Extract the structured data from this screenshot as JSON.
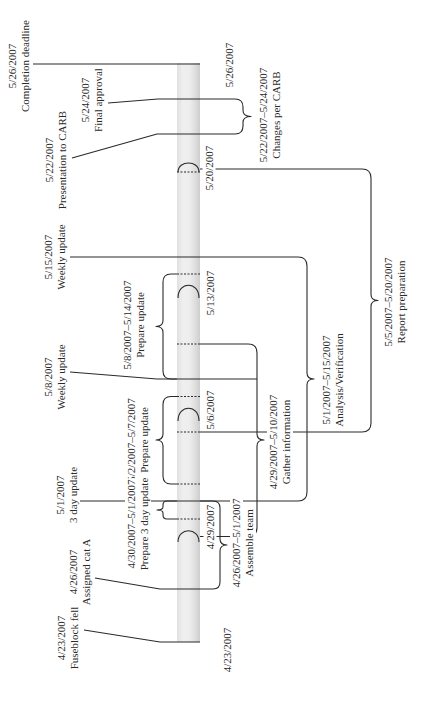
{
  "diagram": {
    "type": "timeline",
    "colors": {
      "line": "#2a2a2a",
      "bar": "#e6e6e6",
      "background": "#ffffff"
    },
    "events": [
      {
        "date": "5/26/2007",
        "label": "Completion deadline"
      },
      {
        "date": "5/24/2007",
        "label": "Final approval"
      },
      {
        "date": "5/22/2007",
        "label": "Presentation to CARB"
      },
      {
        "date": "5/15/2007",
        "label": "Weekly update"
      },
      {
        "date": "5/8/2007",
        "label": "Weekly update"
      },
      {
        "date": "5/1/2007",
        "label": "3 day update"
      },
      {
        "date": "4/26/2007",
        "label": "Assigned cat A"
      },
      {
        "date": "4/23/2007",
        "label": "Fuseblock fell"
      }
    ],
    "tasks_left": [
      {
        "range": "5/8/2007–5/14/2007",
        "label": "Prepare update"
      },
      {
        "range": "5/2/2007–5/7/2007",
        "label": "Prepare update"
      },
      {
        "range": "4/30/2007–5/1/2007",
        "label": "Prepare 3 day update"
      }
    ],
    "tasks_right": [
      {
        "range": "5/22/2007–5/24/2007",
        "label": "Changes per CARB"
      },
      {
        "range": "5/5/2007–5/20/2007",
        "label": "Report preparation"
      },
      {
        "range": "5/1/2007–5/15/2007",
        "label": "Analysis/Verification"
      },
      {
        "range": "4/29/2007–5/10/2007",
        "label": "Gather information"
      },
      {
        "range": "4/26/2007–5/1/2007",
        "label": "Assemble team"
      }
    ],
    "axis_ticks": [
      "5/26/2007",
      "5/20/2007",
      "5/13/2007",
      "5/6/2007",
      "4/29/2007",
      "4/23/2007"
    ]
  }
}
